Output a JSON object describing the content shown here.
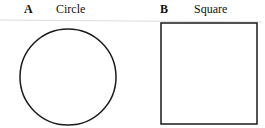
{
  "panels": [
    {
      "letter": "A",
      "title": "Circle",
      "shape": "circle"
    },
    {
      "letter": "B",
      "title": "Square",
      "shape": "square"
    }
  ],
  "colors": {
    "stroke": "#1a1a1a",
    "rule": "#d8d8d8",
    "background": "#ffffff"
  }
}
